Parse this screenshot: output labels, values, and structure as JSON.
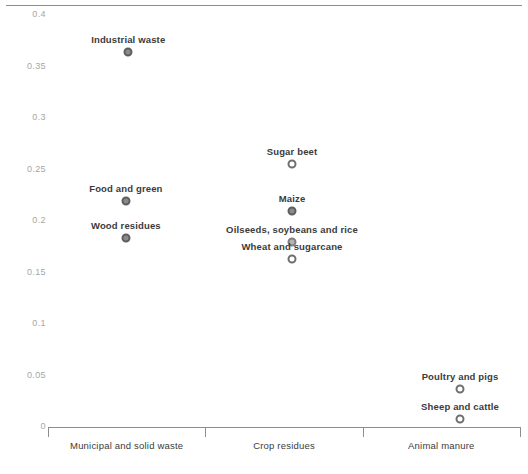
{
  "chart_data": {
    "type": "scatter",
    "title": "",
    "subtitle": "",
    "xlabel": "",
    "ylabel": "",
    "ylim": [
      0,
      0.4
    ],
    "grid": false,
    "legend_position": "none",
    "yticks": [
      "0.4",
      "0.35",
      "0.3",
      "0.25",
      "0.2",
      "0.15",
      "0.1",
      "0.05",
      "0"
    ],
    "ytick_values": [
      0.4,
      0.35,
      0.3,
      0.25,
      0.2,
      0.15,
      0.1,
      0.05,
      0
    ],
    "categories": [
      "Municipal and solid waste",
      "Crop residues",
      "Animal manure"
    ],
    "points": [
      {
        "label": "Industrial waste",
        "category": "Municipal and solid waste",
        "value": 0.363,
        "marker": "filled",
        "x_frac": 0.17
      },
      {
        "label": "Food and green",
        "category": "Municipal and solid waste",
        "value": 0.218,
        "marker": "filled",
        "x_frac": 0.165
      },
      {
        "label": "Wood residues",
        "category": "Municipal and solid waste",
        "value": 0.183,
        "marker": "filled",
        "x_frac": 0.165
      },
      {
        "label": "Sugar beet",
        "category": "Crop residues",
        "value": 0.254,
        "marker": "hollow",
        "x_frac": 0.517
      },
      {
        "label": "Maize",
        "category": "Crop residues",
        "value": 0.209,
        "marker": "filled",
        "x_frac": 0.517
      },
      {
        "label": "Oilseeds, soybeans and rice",
        "category": "Crop residues",
        "value": 0.179,
        "marker": "mid",
        "x_frac": 0.517
      },
      {
        "label": "Wheat and sugarcane",
        "category": "Crop residues",
        "value": 0.162,
        "marker": "hollow",
        "x_frac": 0.517
      },
      {
        "label": "Poultry and pigs",
        "category": "Animal manure",
        "value": 0.036,
        "marker": "hollow",
        "x_frac": 0.873
      },
      {
        "label": "Sheep and cattle",
        "category": "Animal manure",
        "value": 0.007,
        "marker": "hollow",
        "x_frac": 0.873
      }
    ]
  },
  "colors": {
    "axis": "#8d8d8d",
    "tick_label": "#a6a6a6",
    "point_label": "#3b3b3b",
    "marker_fill": "#8a8a8a",
    "marker_stroke": "#5e5e5e",
    "background": "#ffffff"
  }
}
